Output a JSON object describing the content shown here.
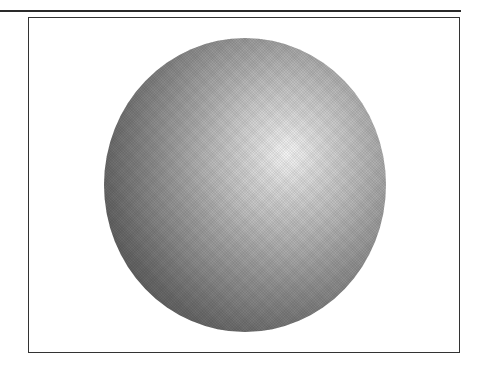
{
  "figure": {
    "colors": {
      "highlight": "#f4f4f4",
      "midtone": "#b8b8b8",
      "shadow": "#555555",
      "frame": "#333333",
      "background": "#ffffff"
    }
  }
}
